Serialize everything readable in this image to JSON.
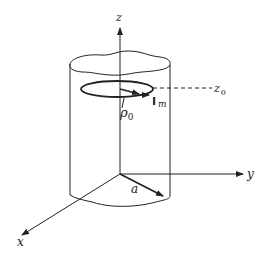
{
  "diagram": {
    "type": "3d-cylinder-with-current-loop",
    "axes": {
      "z_label": "z",
      "y_label": "y",
      "x_label": "x"
    },
    "labels": {
      "radius_label": "a",
      "loop_radius": "ρ",
      "loop_radius_sub": "0",
      "current_label": "I",
      "current_sub": "m",
      "height_label": "z",
      "height_sub": "0"
    },
    "colors": {
      "stroke": "#222222",
      "background": "#ffffff"
    }
  }
}
